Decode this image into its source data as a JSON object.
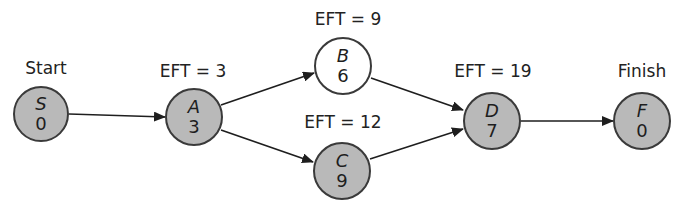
{
  "diagram": {
    "type": "activity-network",
    "colors": {
      "node_fill_grey": "#b9b9b9",
      "node_fill_white": "#ffffff",
      "node_border": "#3a3a3a",
      "edge": "#1e1e1e",
      "text": "#222222"
    },
    "nodes": [
      {
        "id": "S",
        "name": "S",
        "duration": "0",
        "label": "Start",
        "cx": 41,
        "cy": 114,
        "r": 28,
        "fill": "grey",
        "label_x": 46,
        "label_y": 60
      },
      {
        "id": "A",
        "name": "A",
        "duration": "3",
        "label": "EFT = 3",
        "cx": 194,
        "cy": 117,
        "r": 29,
        "fill": "grey",
        "label_x": 193,
        "label_y": 63
      },
      {
        "id": "B",
        "name": "B",
        "duration": "6",
        "label": "EFT = 9",
        "cx": 343,
        "cy": 66,
        "r": 29,
        "fill": "white",
        "label_x": 348,
        "label_y": 11
      },
      {
        "id": "C",
        "name": "C",
        "duration": "9",
        "label": "EFT = 12",
        "cx": 342,
        "cy": 171,
        "r": 29,
        "fill": "grey",
        "label_x": 343,
        "label_y": 114
      },
      {
        "id": "D",
        "name": "D",
        "duration": "7",
        "label": "EFT = 19",
        "cx": 492,
        "cy": 121,
        "r": 29,
        "fill": "grey",
        "label_x": 493,
        "label_y": 63
      },
      {
        "id": "F",
        "name": "F",
        "duration": "0",
        "label": "Finish",
        "cx": 642,
        "cy": 121,
        "r": 29,
        "fill": "grey",
        "label_x": 642,
        "label_y": 63
      }
    ],
    "edges": [
      {
        "from": "S",
        "to": "A",
        "x1": 69,
        "y1": 114,
        "x2": 165,
        "y2": 117
      },
      {
        "from": "A",
        "to": "B",
        "x1": 221,
        "y1": 105,
        "x2": 314,
        "y2": 73
      },
      {
        "from": "A",
        "to": "C",
        "x1": 221,
        "y1": 130,
        "x2": 313,
        "y2": 162
      },
      {
        "from": "B",
        "to": "D",
        "x1": 371,
        "y1": 78,
        "x2": 463,
        "y2": 110
      },
      {
        "from": "C",
        "to": "D",
        "x1": 370,
        "y1": 159,
        "x2": 463,
        "y2": 129
      },
      {
        "from": "D",
        "to": "F",
        "x1": 521,
        "y1": 121,
        "x2": 613,
        "y2": 121
      }
    ]
  }
}
